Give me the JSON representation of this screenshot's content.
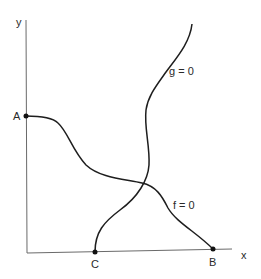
{
  "diagram": {
    "axes": {
      "x_label": "x",
      "y_label": "y"
    },
    "points": {
      "A": "A",
      "B": "B",
      "C": "C"
    },
    "curves": {
      "f": {
        "label": "f = 0",
        "from": "A",
        "to": "B"
      },
      "g": {
        "label": "g = 0",
        "from": "C",
        "to": "top"
      }
    },
    "colors": {
      "curve": "#1e1e1e",
      "axis": "#6a6a6a",
      "text": "#2a2a2a",
      "background": "#ffffff"
    }
  }
}
